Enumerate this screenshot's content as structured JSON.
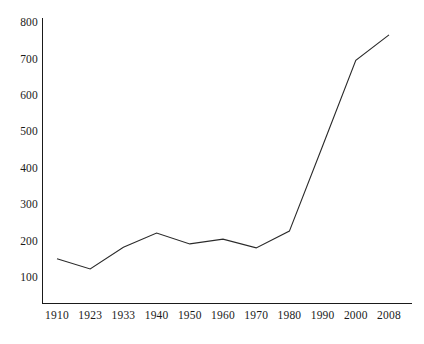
{
  "chart_data": {
    "type": "line",
    "title": "",
    "subtitle": "",
    "xlabel": "",
    "ylabel": "",
    "categories": [
      "1910",
      "1923",
      "1933",
      "1940",
      "1950",
      "1960",
      "1970",
      "1980",
      "1990",
      "2000",
      "2008"
    ],
    "values": [
      150,
      122,
      182,
      221,
      191,
      204,
      180,
      226,
      460,
      695,
      765
    ],
    "series": [
      {
        "name": "",
        "values": [
          150,
          122,
          182,
          221,
          191,
          204,
          180,
          226,
          460,
          695,
          765
        ]
      }
    ],
    "ylim": [
      0,
      800
    ],
    "yticks": [
      100,
      200,
      300,
      400,
      500,
      600,
      700,
      800
    ],
    "ytick_labels": [
      "100",
      "200",
      "300",
      "400",
      "500",
      "600",
      "700",
      "800"
    ],
    "xtick_labels": [
      "1910",
      "1923",
      "1933",
      "1940",
      "1950",
      "1960",
      "1970",
      "1980",
      "1990",
      "2000",
      "2008"
    ],
    "grid": false,
    "legend": null,
    "legend_position": "none",
    "line_color": "#2a2a2a",
    "axis_color": "#1a1a1a",
    "background_color": "#ffffff",
    "annotations": []
  }
}
